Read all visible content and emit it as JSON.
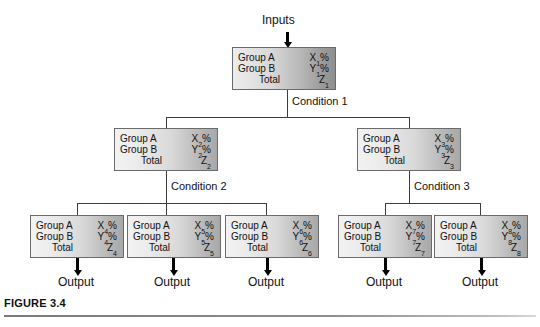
{
  "figure": {
    "caption": "FIGURE 3.4",
    "inputs_label": "Inputs",
    "output_label": "Output"
  },
  "labels": {
    "group_a": "Group A",
    "group_b": "Group B",
    "total": "Total",
    "percent": "%"
  },
  "conditions": [
    {
      "id": "condition-1",
      "label": "Condition 1"
    },
    {
      "id": "condition-2",
      "label": "Condition 2"
    },
    {
      "id": "condition-3",
      "label": "Condition 3"
    }
  ],
  "outputs": [
    {
      "label": "Output"
    },
    {
      "label": "Output"
    },
    {
      "label": "Output"
    },
    {
      "label": "Output"
    },
    {
      "label": "Output"
    }
  ],
  "nodes": [
    {
      "id": "node-1",
      "level": "root",
      "group_a_label": "Group A",
      "group_a_value": "X",
      "group_a_sub": "1",
      "group_a_unit": "%",
      "group_b_label": "Group B",
      "group_b_value": "Y",
      "group_b_sub": "1",
      "group_b_unit": "%",
      "total_label": "Total",
      "total_value": "Z",
      "total_sub": "1",
      "total_unit": ""
    },
    {
      "id": "node-2",
      "level": "mid",
      "group_a_label": "Group A",
      "group_a_value": "X",
      "group_a_sub": "2",
      "group_a_unit": "%",
      "group_b_label": "Group B",
      "group_b_value": "Y",
      "group_b_sub": "2",
      "group_b_unit": "%",
      "total_label": "Total",
      "total_value": "Z",
      "total_sub": "2",
      "total_unit": ""
    },
    {
      "id": "node-3",
      "level": "mid",
      "group_a_label": "Group A",
      "group_a_value": "X",
      "group_a_sub": "3",
      "group_a_unit": "%",
      "group_b_label": "Group B",
      "group_b_value": "Y",
      "group_b_sub": "3",
      "group_b_unit": "%",
      "total_label": "Total",
      "total_value": "Z",
      "total_sub": "3",
      "total_unit": ""
    },
    {
      "id": "node-4",
      "level": "leaf",
      "group_a_label": "Group A",
      "group_a_value": "X",
      "group_a_sub": "4",
      "group_a_unit": "%",
      "group_b_label": "Group B",
      "group_b_value": "Y",
      "group_b_sub": "4",
      "group_b_unit": "%",
      "total_label": "Total",
      "total_value": "Z",
      "total_sub": "4",
      "total_unit": ""
    },
    {
      "id": "node-5",
      "level": "leaf",
      "group_a_label": "Group A",
      "group_a_value": "X",
      "group_a_sub": "5",
      "group_a_unit": "%",
      "group_b_label": "Group B",
      "group_b_value": "Y",
      "group_b_sub": "5",
      "group_b_unit": "%",
      "total_label": "Total",
      "total_value": "Z",
      "total_sub": "5",
      "total_unit": ""
    },
    {
      "id": "node-6",
      "level": "leaf",
      "group_a_label": "Group A",
      "group_a_value": "X",
      "group_a_sub": "6",
      "group_a_unit": "%",
      "group_b_label": "Group B",
      "group_b_value": "Y",
      "group_b_sub": "6",
      "group_b_unit": "%",
      "total_label": "Total",
      "total_value": "Z",
      "total_sub": "6",
      "total_unit": ""
    },
    {
      "id": "node-7",
      "level": "leaf",
      "group_a_label": "Group A",
      "group_a_value": "X",
      "group_a_sub": "7",
      "group_a_unit": "%",
      "group_b_label": "Group B",
      "group_b_value": "Y",
      "group_b_sub": "7",
      "group_b_unit": "%",
      "total_label": "Total",
      "total_value": "Z",
      "total_sub": "7",
      "total_unit": ""
    },
    {
      "id": "node-8",
      "level": "leaf",
      "group_a_label": "Group A",
      "group_a_value": "X",
      "group_a_sub": "8",
      "group_a_unit": "%",
      "group_b_label": "Group B",
      "group_b_value": "Y",
      "group_b_sub": "8",
      "group_b_unit": "%",
      "total_label": "Total",
      "total_value": "Z",
      "total_sub": "8",
      "total_unit": ""
    }
  ],
  "colors": {
    "box_border": "#6b6b6b",
    "box_fill_light": "#f2f2f2",
    "box_fill_dark": "#a8a8a8",
    "connector": "#3d3d3d",
    "arrow": "#000000",
    "text": "#111111",
    "rule": "#8d8d8d"
  }
}
